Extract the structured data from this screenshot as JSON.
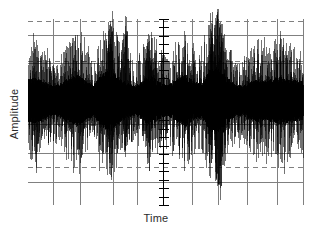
{
  "figure": {
    "background_color": "#ffffff",
    "ink_color": "#000000",
    "grid_color": "#808080",
    "label_color": "#2b2b2b"
  },
  "chart_data": {
    "type": "line",
    "title": "",
    "subtitle": "",
    "xlabel": "Time",
    "ylabel": "Amplitude",
    "legend": [],
    "annotations": [],
    "grid": true,
    "grid_style": "mixed solid and dashed rectangular grid",
    "xlim": [
      0,
      1
    ],
    "ylim": [
      -1,
      1
    ],
    "xtick_labels": [],
    "ytick_labels": [],
    "axis_ticks": {
      "center_vertical_axis_x": 0.49,
      "tick_count": 23,
      "tick_half_width_px": 5,
      "description": "unlabeled tick marks along central vertical axis"
    },
    "vertical_gridlines_x": [
      0.091,
      0.189,
      0.309,
      0.396,
      0.491,
      0.596,
      0.691,
      0.796,
      0.905,
      1.0
    ],
    "horizontal_gridlines": [
      {
        "y": 0.98,
        "style": "dashed"
      },
      {
        "y": 0.8,
        "style": "solid"
      },
      {
        "y": 0.49,
        "style": "dashed"
      },
      {
        "y": 0.46,
        "style": "solid"
      },
      {
        "y": -0.29,
        "style": "solid"
      },
      {
        "y": -0.64,
        "style": "solid"
      },
      {
        "y": -0.81,
        "style": "dashed"
      },
      {
        "y": -1.0,
        "style": "solid"
      }
    ],
    "series": [
      {
        "name": "signal",
        "type": "dense-noise-waveform",
        "color": "#000000",
        "description": "Broadband zero-mean random signal with time-varying amplitude envelope and intermittent high-amplitude bursts",
        "sample_count": 1400,
        "envelope_x": [
          0.0,
          0.03,
          0.06,
          0.09,
          0.12,
          0.15,
          0.18,
          0.21,
          0.24,
          0.27,
          0.3,
          0.33,
          0.36,
          0.39,
          0.42,
          0.45,
          0.48,
          0.51,
          0.54,
          0.57,
          0.6,
          0.63,
          0.66,
          0.69,
          0.72,
          0.75,
          0.78,
          0.81,
          0.84,
          0.87,
          0.9,
          0.93,
          0.96,
          1.0
        ],
        "envelope_y": [
          0.62,
          0.7,
          0.55,
          0.44,
          0.52,
          0.66,
          0.78,
          0.58,
          0.47,
          0.8,
          0.92,
          0.7,
          0.52,
          0.44,
          0.61,
          0.74,
          0.56,
          0.48,
          0.62,
          0.8,
          0.58,
          0.52,
          0.9,
          1.0,
          0.74,
          0.5,
          0.44,
          0.58,
          0.66,
          0.6,
          0.68,
          0.72,
          0.62,
          0.58
        ],
        "burst_peaks": [
          {
            "x": 0.3,
            "y_max": 0.92,
            "y_min": -0.78
          },
          {
            "x": 0.355,
            "y_max": 0.98,
            "y_min": -0.7
          },
          {
            "x": 0.44,
            "y_max": 0.82,
            "y_min": -0.88
          },
          {
            "x": 0.665,
            "y_max": 1.02,
            "y_min": -0.8
          },
          {
            "x": 0.688,
            "y_max": 1.04,
            "y_min": -1.05
          },
          {
            "x": 0.7,
            "y_max": 0.88,
            "y_min": -1.18
          }
        ]
      }
    ]
  }
}
